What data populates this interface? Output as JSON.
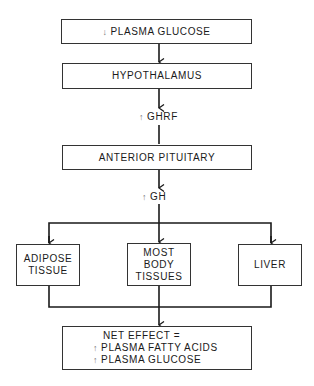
{
  "diagram": {
    "type": "flowchart",
    "nodes": {
      "plasma_glucose": {
        "arrow": "↓",
        "label": "PLASMA GLUCOSE"
      },
      "hypothalamus": {
        "label": "HYPOTHALAMUS"
      },
      "anterior_pituitary": {
        "label": "ANTERIOR PITUITARY"
      },
      "adipose": {
        "line1": "ADIPOSE",
        "line2": "TISSUE"
      },
      "most_body": {
        "line1": "MOST",
        "line2": "BODY",
        "line3": "TISSUES"
      },
      "liver": {
        "label": "LIVER"
      },
      "net_effect": {
        "title": "NET EFFECT =",
        "items": [
          {
            "arrow": "↑",
            "label": "PLASMA FATTY ACIDS"
          },
          {
            "arrow": "↑",
            "label": "PLASMA GLUCOSE"
          }
        ]
      }
    },
    "edge_labels": {
      "ghrf": {
        "arrow": "↑",
        "label": "GHRF"
      },
      "gh": {
        "arrow": "↑",
        "label": "GH"
      }
    },
    "edges": [
      [
        "plasma_glucose",
        "hypothalamus"
      ],
      [
        "hypothalamus",
        "anterior_pituitary"
      ],
      [
        "anterior_pituitary",
        "adipose"
      ],
      [
        "anterior_pituitary",
        "most_body"
      ],
      [
        "anterior_pituitary",
        "liver"
      ],
      [
        "adipose",
        "net_effect"
      ],
      [
        "most_body",
        "net_effect"
      ],
      [
        "liver",
        "net_effect"
      ]
    ]
  }
}
